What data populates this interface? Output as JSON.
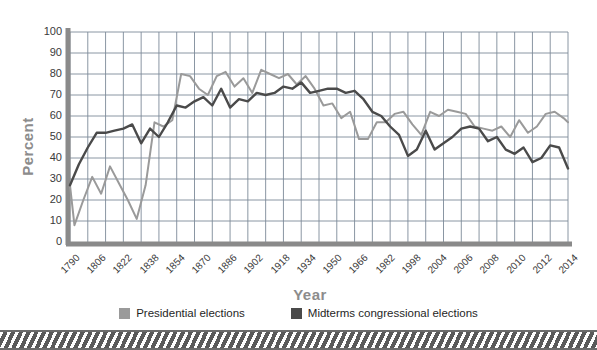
{
  "chart_data": {
    "type": "line",
    "title": "",
    "xlabel": "Year",
    "ylabel": "Percent",
    "ylim": [
      0,
      100
    ],
    "yticks": [
      0,
      10,
      20,
      30,
      40,
      50,
      60,
      70,
      80,
      90,
      100
    ],
    "xtick_labels": [
      "1790",
      "1806",
      "1822",
      "1838",
      "1854",
      "1870",
      "1886",
      "1902",
      "1918",
      "1934",
      "1950",
      "1966",
      "1982",
      "1998",
      "2004",
      "2006",
      "2008",
      "2010",
      "2012",
      "2014"
    ],
    "grid": true,
    "legend_position": "bottom",
    "colors": {
      "presidential": "#9a9a9a",
      "midterms": "#4a4a4a",
      "grid": "#7d8a99",
      "axis": "#8a8a8a",
      "axis_title": "#8c8c8c",
      "tick_text": "#3a3a3a"
    },
    "x": [
      1790,
      1792,
      1794,
      1796,
      1798,
      1800,
      1802,
      1804,
      1806,
      1808,
      1810,
      1812,
      1814,
      1816,
      1818,
      1820,
      1822,
      1824,
      1826,
      1828,
      1830,
      1832,
      1834,
      1836,
      1838,
      1840,
      1842,
      1844,
      1846,
      1848,
      1850,
      1852,
      1854,
      1856,
      1858,
      1860,
      1862,
      1864,
      1866,
      1868,
      1870,
      1872,
      1874,
      1876,
      1878,
      1880,
      1882,
      1884,
      1886,
      1888,
      1890,
      1892,
      1894,
      1896,
      1898,
      1900,
      1902,
      1904,
      1906,
      1908,
      1910,
      1912,
      1914,
      1916,
      1918,
      1920,
      1922,
      1924,
      1926,
      1928,
      1930,
      1932,
      1934,
      1936,
      1938,
      1940,
      1942,
      1944,
      1946,
      1948,
      1950,
      1952,
      1954,
      1956,
      1958,
      1960,
      1962,
      1964,
      1966,
      1968,
      1970,
      1972,
      1974,
      1976,
      1978,
      1980,
      1982,
      1984,
      1986,
      1988,
      1990,
      1992,
      1994,
      1996,
      1998,
      2000,
      2002,
      2004,
      2006,
      2008,
      2010,
      2012,
      2014
    ],
    "series": [
      {
        "name": "Presidential elections",
        "color": "#9a9a9a",
        "points": [
          [
            1790,
            27
          ],
          [
            1792,
            8
          ],
          [
            1796,
            20
          ],
          [
            1800,
            31
          ],
          [
            1804,
            23
          ],
          [
            1808,
            36
          ],
          [
            1812,
            28
          ],
          [
            1816,
            20
          ],
          [
            1820,
            11
          ],
          [
            1824,
            27
          ],
          [
            1828,
            57
          ],
          [
            1832,
            55
          ],
          [
            1836,
            58
          ],
          [
            1840,
            80
          ],
          [
            1844,
            79
          ],
          [
            1848,
            73
          ],
          [
            1852,
            70
          ],
          [
            1856,
            79
          ],
          [
            1860,
            81
          ],
          [
            1864,
            74
          ],
          [
            1868,
            78
          ],
          [
            1872,
            71
          ],
          [
            1876,
            82
          ],
          [
            1880,
            80
          ],
          [
            1884,
            78
          ],
          [
            1888,
            80
          ],
          [
            1892,
            75
          ],
          [
            1896,
            79
          ],
          [
            1900,
            73
          ],
          [
            1904,
            65
          ],
          [
            1908,
            66
          ],
          [
            1912,
            59
          ],
          [
            1916,
            62
          ],
          [
            1920,
            49
          ],
          [
            1924,
            49
          ],
          [
            1928,
            57
          ],
          [
            1932,
            57
          ],
          [
            1936,
            61
          ],
          [
            1940,
            62
          ],
          [
            1944,
            56
          ],
          [
            1948,
            51
          ],
          [
            1952,
            62
          ],
          [
            1956,
            60
          ],
          [
            1960,
            63
          ],
          [
            1964,
            62
          ],
          [
            1968,
            61
          ],
          [
            1972,
            55
          ],
          [
            1976,
            54
          ],
          [
            1980,
            53
          ],
          [
            1984,
            55
          ],
          [
            1988,
            50
          ],
          [
            1992,
            58
          ],
          [
            1996,
            52
          ],
          [
            2000,
            55
          ],
          [
            2004,
            61
          ],
          [
            2008,
            62
          ],
          [
            2012,
            59
          ],
          [
            2014,
            57
          ]
        ]
      },
      {
        "name": "Midterms congressional elections",
        "color": "#4a4a4a",
        "points": [
          [
            1790,
            27
          ],
          [
            1794,
            37
          ],
          [
            1798,
            45
          ],
          [
            1802,
            52
          ],
          [
            1806,
            52
          ],
          [
            1810,
            53
          ],
          [
            1814,
            54
          ],
          [
            1818,
            56
          ],
          [
            1822,
            47
          ],
          [
            1826,
            54
          ],
          [
            1830,
            50
          ],
          [
            1834,
            57
          ],
          [
            1838,
            65
          ],
          [
            1842,
            64
          ],
          [
            1846,
            67
          ],
          [
            1850,
            69
          ],
          [
            1854,
            65
          ],
          [
            1858,
            73
          ],
          [
            1862,
            64
          ],
          [
            1866,
            68
          ],
          [
            1870,
            67
          ],
          [
            1874,
            71
          ],
          [
            1878,
            70
          ],
          [
            1882,
            71
          ],
          [
            1886,
            74
          ],
          [
            1890,
            73
          ],
          [
            1894,
            76
          ],
          [
            1898,
            71
          ],
          [
            1902,
            72
          ],
          [
            1906,
            73
          ],
          [
            1910,
            73
          ],
          [
            1914,
            71
          ],
          [
            1918,
            72
          ],
          [
            1922,
            68
          ],
          [
            1926,
            62
          ],
          [
            1930,
            60
          ],
          [
            1934,
            55
          ],
          [
            1938,
            51
          ],
          [
            1942,
            41
          ],
          [
            1946,
            44
          ],
          [
            1950,
            53
          ],
          [
            1954,
            44
          ],
          [
            1958,
            47
          ],
          [
            1962,
            50
          ],
          [
            1966,
            54
          ],
          [
            1970,
            55
          ],
          [
            1974,
            54
          ],
          [
            1978,
            48
          ],
          [
            1982,
            50
          ],
          [
            1986,
            44
          ],
          [
            1990,
            42
          ],
          [
            1994,
            45
          ],
          [
            1998,
            38
          ],
          [
            2002,
            40
          ],
          [
            2006,
            46
          ],
          [
            2010,
            45
          ],
          [
            2014,
            35
          ]
        ]
      }
    ]
  },
  "legend": {
    "items": [
      {
        "label": "Presidential elections",
        "color": "#9a9a9a"
      },
      {
        "label": "Midterms congressional elections",
        "color": "#4a4a4a"
      }
    ]
  }
}
